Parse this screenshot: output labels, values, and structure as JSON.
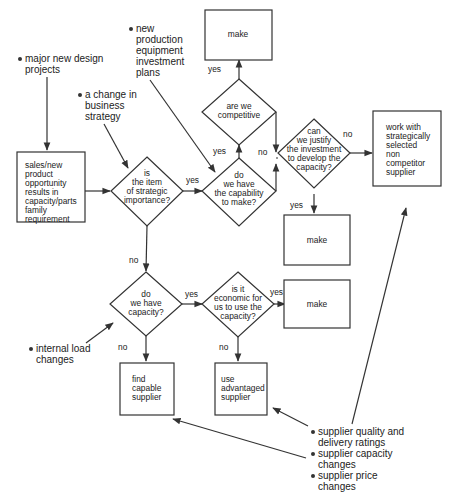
{
  "diagram": {
    "type": "flowchart",
    "colors": {
      "line": "#333333",
      "text": "#222222",
      "background": "#ffffff"
    },
    "external_inputs": {
      "major_design": [
        "major new design",
        "projects"
      ],
      "business_strategy": [
        "a change in",
        "business",
        "strategy"
      ],
      "production_equipment": [
        "new",
        "production",
        "equipment",
        "investment",
        "plans"
      ],
      "internal_load": [
        "internal load",
        "changes"
      ],
      "supplier_factors": [
        [
          "supplier quality and",
          "delivery ratings"
        ],
        [
          "supplier capacity",
          "changes"
        ],
        [
          "supplier price",
          "changes"
        ]
      ]
    },
    "nodes": {
      "sales": [
        "sales/new",
        "product",
        "opportunity",
        "results in",
        "capacity/parts",
        "family",
        "requirement"
      ],
      "strategic": [
        "is",
        "the item",
        "of strategic",
        "importance?"
      ],
      "capability": [
        "do",
        "we have",
        "the capability",
        "to make?"
      ],
      "competitive": [
        "are we",
        "competitive"
      ],
      "make_top": [
        "make"
      ],
      "justify": [
        "can",
        "we justify",
        "the investment",
        "to develop the",
        "capacity?"
      ],
      "work_with": [
        "work with",
        "strategically",
        "selected",
        "non",
        "competitor",
        "supplier"
      ],
      "make_mid": [
        "make"
      ],
      "have_capacity": [
        "do",
        "we have",
        "capacity?"
      ],
      "economic": [
        "is it",
        "economic for",
        "us to use the",
        "capacity?"
      ],
      "make_low": [
        "make"
      ],
      "find_supplier": [
        "find",
        "capable",
        "supplier"
      ],
      "use_supplier": [
        "use",
        "advantaged",
        "supplier"
      ]
    },
    "edge_labels": {
      "strategic_yes": "yes",
      "strategic_no": "no",
      "capability_yes": "yes",
      "capability_no": "no",
      "competitive_yes": "yes",
      "justify_yes": "yes",
      "justify_no": "no",
      "capacity_yes": "yes",
      "capacity_no": "no",
      "economic_yes": "yes",
      "economic_no": "no"
    }
  }
}
